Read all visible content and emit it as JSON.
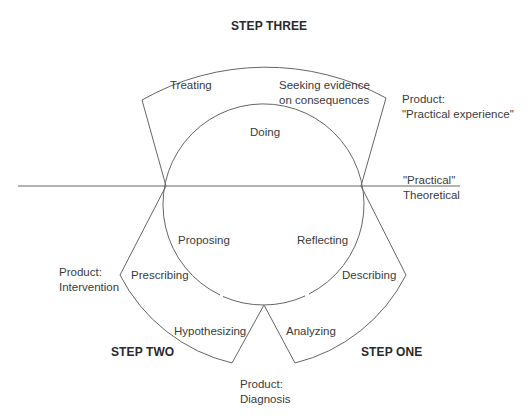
{
  "diagram": {
    "steps": {
      "one": "STEP ONE",
      "two": "STEP TWO",
      "three": "STEP THREE"
    },
    "circle_labels": {
      "doing": "Doing",
      "proposing": "Proposing",
      "reflecting": "Reflecting"
    },
    "step_three_labels": {
      "treating": "Treating",
      "seeking_line1": "Seeking evidence",
      "seeking_line2": "on consequences"
    },
    "step_two_labels": {
      "prescribing": "Prescribing",
      "hypothesizing": "Hypothesizing"
    },
    "step_one_labels": {
      "describing": "Describing",
      "analyzing": "Analyzing"
    },
    "products": {
      "practical_line1": "Product:",
      "practical_line2": "\"Practical experience\"",
      "intervention_line1": "Product:",
      "intervention_line2": "Intervention",
      "diagnosis_line1": "Product:",
      "diagnosis_line2": "Diagnosis"
    },
    "axis_labels": {
      "above": "\"Practical\"",
      "below": "Theoretical"
    },
    "colors": {
      "line": "#555555",
      "text": "#3b3b3b"
    }
  }
}
